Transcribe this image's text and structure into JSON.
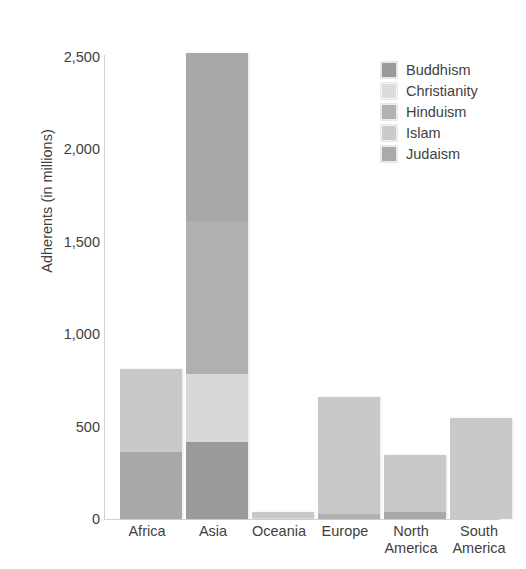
{
  "chart_data": {
    "type": "bar",
    "subtype": "stacked-bar",
    "title": "Adherent",
    "title_truncated": true,
    "xlabel": "",
    "ylabel": "Adherents (in millions)",
    "ylim": [
      0,
      2500
    ],
    "yticks": [
      0,
      500,
      1000,
      1500,
      2000,
      2500
    ],
    "ytick_labels": [
      "0",
      "500",
      "1,000",
      "1,500",
      "2,000",
      "2,500"
    ],
    "grid": false,
    "legend_position": "top-right",
    "categories": [
      "Africa",
      "Asia",
      "Oceania",
      "Europe",
      "North\nAmerica",
      "South\nAmerica"
    ],
    "category_labels": [
      "Africa",
      "Asia",
      "Oceania",
      "Europe",
      "North America",
      "South America"
    ],
    "series": [
      {
        "name": "Buddhism",
        "color": "#9a9a9a",
        "values": [
          0,
          416,
          0,
          0,
          0,
          0
        ]
      },
      {
        "name": "Christianity",
        "color": "#d8d8d8",
        "values": [
          0,
          363,
          8,
          0,
          0,
          0
        ]
      },
      {
        "name": "Hinduism",
        "color": "#b0b0b0",
        "values": [
          0,
          827,
          0,
          26,
          0,
          0
        ]
      },
      {
        "name": "Islam",
        "color": "#c9c9c9",
        "values": [
          444,
          0,
          32,
          634,
          310,
          546
        ]
      },
      {
        "name": "Judaism",
        "color": "#a8a8a8",
        "values": [
          362,
          904,
          0,
          0,
          36,
          0
        ]
      }
    ],
    "totals": [
      806,
      2510,
      40,
      660,
      346,
      546
    ]
  },
  "legend": {
    "items": [
      {
        "label": "Buddhism",
        "color": "#9a9a9a"
      },
      {
        "label": "Christianity",
        "color": "#dcdcdc"
      },
      {
        "label": "Hinduism",
        "color": "#b2b2b2"
      },
      {
        "label": "Islam",
        "color": "#cbcbcb"
      },
      {
        "label": "Judaism",
        "color": "#aaaaaa"
      }
    ]
  },
  "axes": {
    "y_label": "Adherents (in millions)",
    "y_ticks": [
      "2,500",
      "2,000",
      "1,500",
      "1,000",
      "500",
      "0"
    ],
    "x_labels": [
      "Africa",
      "Asia",
      "Oceania",
      "Europe",
      "North\nAmerica",
      "South\nAmerica"
    ]
  },
  "header": {
    "title": "ent"
  },
  "colors": {
    "axis": "#d2d2d2",
    "text": "#3f3f3f",
    "background": "#ffffff"
  }
}
